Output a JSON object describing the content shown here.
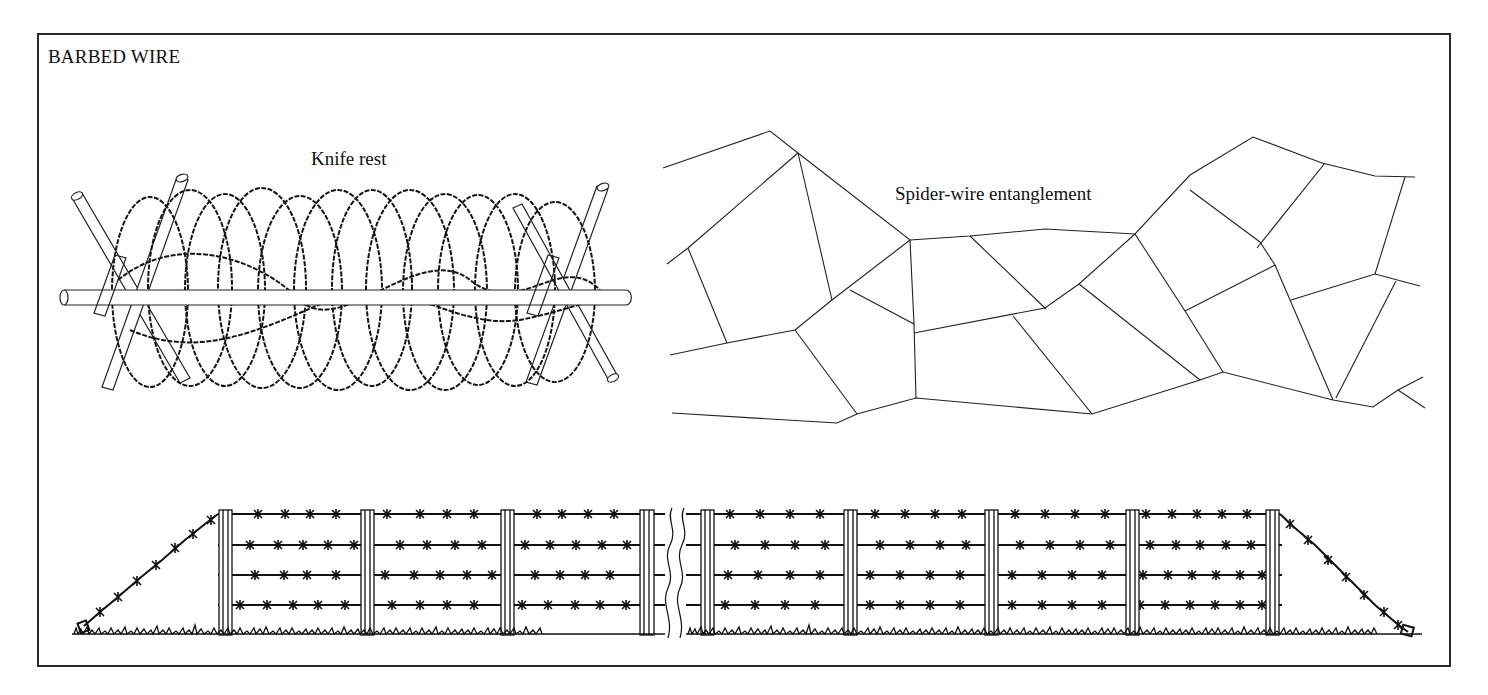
{
  "page": {
    "title": "BARBED WIRE"
  },
  "figures": {
    "knife_rest": {
      "label": "Knife rest"
    },
    "spider_wire": {
      "label": "Spider-wire entanglement"
    },
    "fence": {
      "label": "",
      "posts_left": 4,
      "posts_right": 5,
      "wire_strands": 4,
      "has_break_symbol": true
    }
  },
  "colors": {
    "ink": "#111111",
    "frame": "#2a2a2a",
    "background": "#ffffff"
  }
}
